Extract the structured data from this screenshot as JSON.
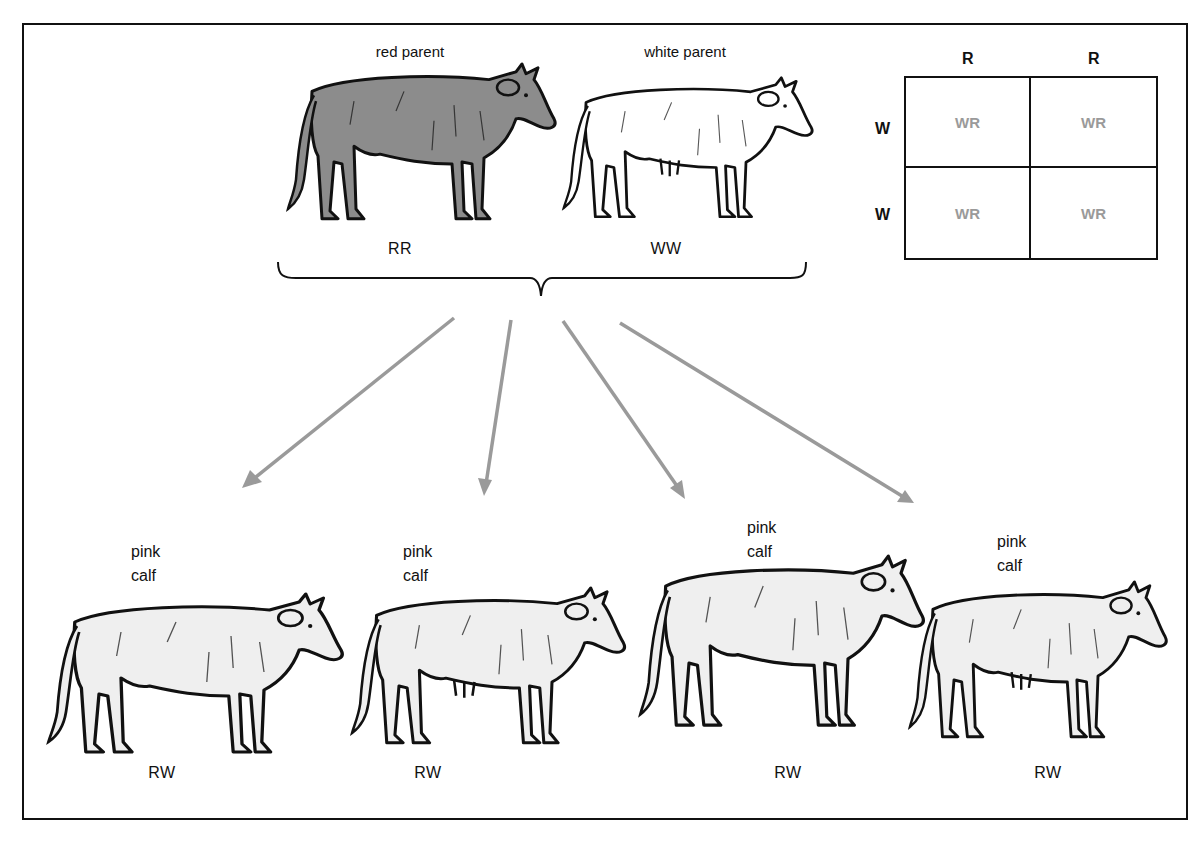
{
  "diagram": {
    "type": "genetics-incomplete-dominance",
    "colors": {
      "outline": "#111111",
      "red_parent_fill": "#8c8c8c",
      "white_parent_fill": "#ffffff",
      "calf_fill": "#efefef",
      "arrow": "#9a9a9a",
      "punnett_offspring_text": "#9a9a9a"
    },
    "parents": [
      {
        "label": "red parent",
        "genotype": "RR"
      },
      {
        "label": "white parent",
        "genotype": "WW"
      }
    ],
    "punnett": {
      "column_headers": [
        "R",
        "R"
      ],
      "row_headers": [
        "W",
        "W"
      ],
      "cells": [
        [
          "WR",
          "WR"
        ],
        [
          "WR",
          "WR"
        ]
      ]
    },
    "offspring": [
      {
        "label_line1": "pink",
        "label_line2": "calf",
        "genotype": "RW"
      },
      {
        "label_line1": "pink",
        "label_line2": "calf",
        "genotype": "RW"
      },
      {
        "label_line1": "pink",
        "label_line2": "calf",
        "genotype": "RW"
      },
      {
        "label_line1": "pink",
        "label_line2": "calf",
        "genotype": "RW"
      }
    ],
    "arrow_count": 4
  }
}
